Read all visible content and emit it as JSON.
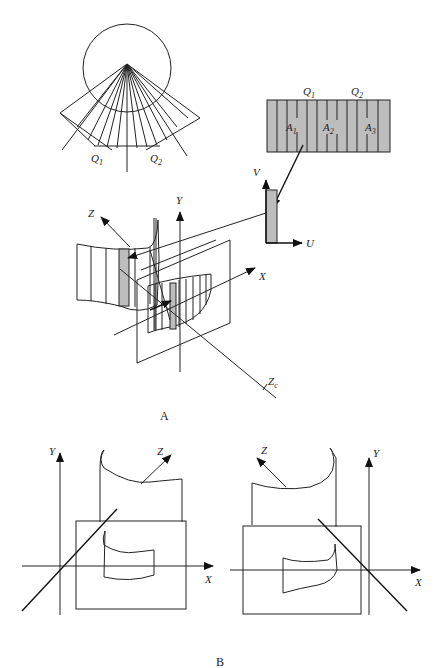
{
  "figure": {
    "caption_a": "A",
    "caption_b": "B"
  },
  "fan_diagram": {
    "label_q1": "Q",
    "label_q1_sub": "1",
    "label_q2": "Q",
    "label_q2_sub": "2"
  },
  "texture_strip": {
    "label_q1": "Q",
    "label_q1_sub": "1",
    "label_q2": "Q",
    "label_q2_sub": "2",
    "label_a1": "A",
    "label_a1_sub": "1",
    "label_a2": "A",
    "label_a2_sub": "2",
    "label_a3": "A",
    "label_a3_sub": "3",
    "fill_color": "#bdbdbd"
  },
  "uv_axes": {
    "label_u": "U",
    "label_v": "V"
  },
  "panel_a": {
    "label_x": "X",
    "label_y": "Y",
    "label_z": "Z",
    "label_zc": "Z",
    "label_zc_sub": "c"
  },
  "panel_b_left": {
    "label_x": "X",
    "label_y": "Y",
    "label_z": "Z"
  },
  "panel_b_right": {
    "label_x": "X",
    "label_y": "Y",
    "label_z": "Z"
  }
}
